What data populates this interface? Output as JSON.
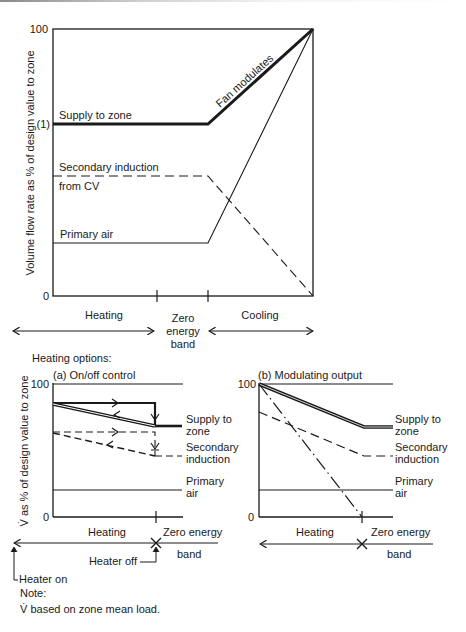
{
  "top_diagram": {
    "y_axis_label": "Volume flow rate as % of design value to zone",
    "y_ticks": {
      "top": "100",
      "mid": "(1)",
      "bottom": "0"
    },
    "labels": {
      "supply": "Supply to zone",
      "fan": "Fan modulates",
      "secondary_line1": "Secondary induction",
      "secondary_line2": "from CV",
      "primary": "Primary air"
    },
    "x_regions": {
      "heating": "Heating",
      "zero_line1": "Zero",
      "zero_line2": "energy",
      "zero_line3": "band",
      "cooling": "Cooling"
    }
  },
  "heating_options_title": "Heating options:",
  "panel_a": {
    "title": "(a) On/off control",
    "y_axis_label": "V̇ as % of design value to zone",
    "y_ticks": {
      "top": "100",
      "bottom": "0"
    },
    "labels": {
      "supply_line1": "Supply to",
      "supply_line2": "zone",
      "secondary_line1": "Secondary",
      "secondary_line2": "induction",
      "primary_line1": "Primary",
      "primary_line2": "air"
    },
    "x_labels": {
      "heating": "Heating",
      "zero_line1": "Zero energy",
      "zero_line2": "band",
      "heater_off": "Heater off",
      "heater_on": "Heater on"
    }
  },
  "panel_b": {
    "title": "(b) Modulating output",
    "y_ticks": {
      "top": "100",
      "bottom": "0"
    },
    "labels": {
      "supply_line1": "Supply to",
      "supply_line2": "zone",
      "secondary_line1": "Secondary",
      "secondary_line2": "induction",
      "primary_line1": "Primary",
      "primary_line2": "air"
    },
    "x_labels": {
      "heating": "Heating",
      "zero_line1": "Zero energy",
      "zero_line2": "band"
    }
  },
  "note": {
    "title": "Note:",
    "text": "V̇ based on zone mean load."
  },
  "colors": {
    "ink": "#1a1a1a",
    "background": "#ffffff"
  }
}
